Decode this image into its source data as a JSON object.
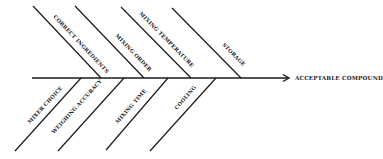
{
  "diagram": {
    "type": "fishbone",
    "effect": "ACCEPTABLE COMPOUND",
    "upper_causes": [
      {
        "label": "CORRECT INGREDIENTS"
      },
      {
        "label": "MIXING ORDER"
      },
      {
        "label": "MIXING TEMPERATURE"
      },
      {
        "label": "STORAGE"
      }
    ],
    "lower_causes": [
      {
        "label": "MIXER CHOICE"
      },
      {
        "label": "WEIGHING ACCURACY"
      },
      {
        "label": "MIXING TIME"
      },
      {
        "label": "COOLING"
      }
    ],
    "colors": {
      "ink": "#1a1a1a",
      "background": "#ffffff"
    }
  }
}
